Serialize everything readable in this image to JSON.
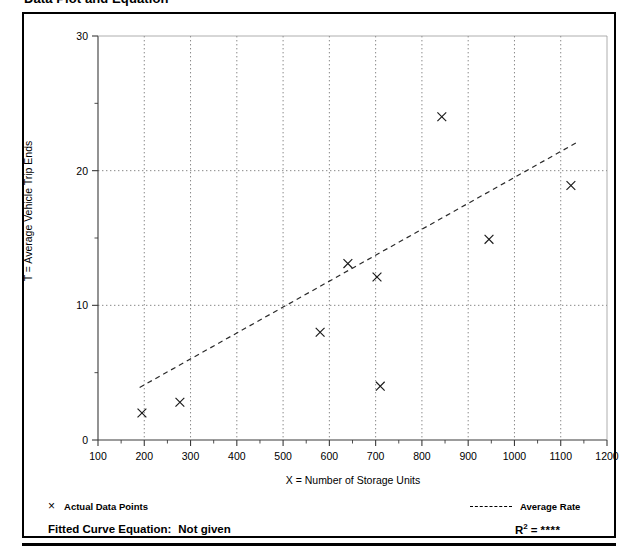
{
  "page": {
    "title": "Data Plot and Equation"
  },
  "footer": {
    "points_marker": "×",
    "points_legend_label": "Actual Data Points",
    "rate_legend_label": "Average Rate",
    "equation_label": "Fitted Curve Equation:",
    "equation_value": "Not given",
    "r2_label": "R",
    "r2_exponent": "2",
    "r2_equals": "=",
    "r2_value": "****"
  },
  "colors": {
    "ink": "#000000",
    "grid": "#7a7a7a",
    "axis": "#3a3a3a",
    "marker": "#1a1a1a",
    "trend": "#2a2a2a",
    "panel_background": "#ffffff"
  },
  "chart_data": {
    "type": "scatter",
    "title": "Data Plot and Equation",
    "xlabel": "X = Number of Storage Units",
    "ylabel": "T = Average Vehicle Trip Ends",
    "xlim": [
      100,
      1200
    ],
    "ylim": [
      0,
      30
    ],
    "xticks": [
      100,
      200,
      300,
      400,
      500,
      600,
      700,
      800,
      900,
      1000,
      1100,
      1200
    ],
    "yticks": [
      0,
      10,
      20,
      30
    ],
    "y_minor_ticks": [
      5,
      15,
      25
    ],
    "x_minor_ticks": [
      150,
      250,
      350,
      450,
      550,
      650,
      750,
      850,
      950,
      1050,
      1150
    ],
    "gridlines_x": [
      200,
      300,
      400,
      500,
      600,
      700,
      800,
      900,
      1000,
      1100
    ],
    "gridlines_y": [
      10,
      20
    ],
    "grid": true,
    "legend_position": "below-plot",
    "series": [
      {
        "name": "Actual Data Points",
        "type": "scatter",
        "marker": "x",
        "points": [
          {
            "x": 195,
            "y": 2.0
          },
          {
            "x": 277,
            "y": 2.8
          },
          {
            "x": 580,
            "y": 8.0
          },
          {
            "x": 640,
            "y": 13.1
          },
          {
            "x": 703,
            "y": 12.1
          },
          {
            "x": 710,
            "y": 4.0
          },
          {
            "x": 843,
            "y": 24.0
          },
          {
            "x": 945,
            "y": 14.9
          },
          {
            "x": 1122,
            "y": 18.9
          }
        ]
      },
      {
        "name": "Average Rate",
        "type": "line",
        "style": "dashed",
        "points": [
          {
            "x": 190,
            "y": 3.9
          },
          {
            "x": 1135,
            "y": 22.1
          }
        ]
      }
    ],
    "annotations": {
      "fitted_curve_equation": "Not given",
      "r_squared": "****"
    }
  }
}
